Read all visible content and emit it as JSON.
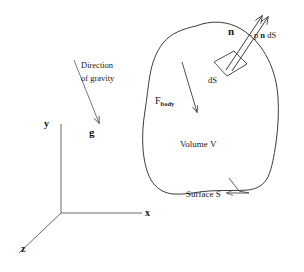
{
  "figure": {
    "stroke_color": "#3c3c3c",
    "text_color": "#171717",
    "background": "#ffffff"
  },
  "axes": {
    "x_label": "x",
    "y_label": "y",
    "z_label": "z"
  },
  "labels": {
    "direction_line1": "Direction",
    "direction_line2": "of gravity",
    "gravity_vector": "g",
    "normal_vector": "n",
    "pressure_force": "- p n dS",
    "pressure_force_prefix": "- p ",
    "pressure_force_vector": "n",
    "pressure_force_suffix": " dS",
    "body_force": "F",
    "body_force_sub": "body",
    "surface_element": "dS",
    "volume": "Volume V",
    "surface": "Surface S"
  }
}
